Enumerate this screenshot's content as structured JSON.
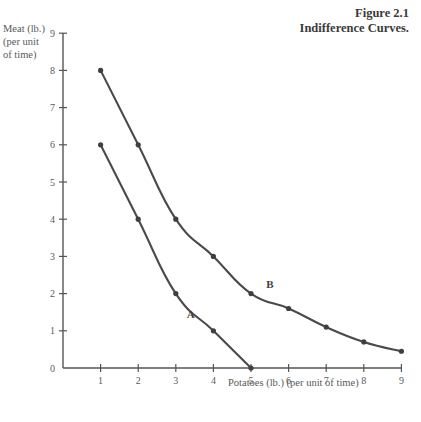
{
  "figure": {
    "title_line_1": "Figure 2.1",
    "title_line_2": "Indifference Curves."
  },
  "axes": {
    "y_caption_line_1": "Meat (lb.)",
    "y_caption_line_2": "(per unit",
    "y_caption_line_3": "of time)",
    "x_caption": "Potatoes (lb.) (per unit of time)",
    "x_ticks": [
      "1",
      "2",
      "3",
      "4",
      "5",
      "6",
      "7",
      "8",
      "9"
    ],
    "y_ticks": [
      "0",
      "1",
      "2",
      "3",
      "4",
      "5",
      "6",
      "7",
      "8",
      "9"
    ]
  },
  "labels": {
    "curve_a": "A",
    "curve_b": "B"
  },
  "colors": {
    "line": "#4a4a4a",
    "point": "#3f3f3f",
    "axis": "#555555",
    "text": "#5a5a5a",
    "title": "#3a3a3a",
    "background": "#ffffff"
  },
  "chart_data": {
    "type": "line",
    "title": "Figure 2.1 Indifference Curves.",
    "xlabel": "Potatoes (lb.) (per unit of time)",
    "ylabel": "Meat (lb.) (per unit of time)",
    "xlim": [
      0,
      9
    ],
    "ylim": [
      0,
      9
    ],
    "xticks": [
      1,
      2,
      3,
      4,
      5,
      6,
      7,
      8,
      9
    ],
    "yticks": [
      0,
      1,
      2,
      3,
      4,
      5,
      6,
      7,
      8,
      9
    ],
    "grid": false,
    "legend": "inline-curve-labels",
    "series": [
      {
        "name": "A",
        "label_position": {
          "x": 3.4,
          "y": 1.35
        },
        "x": [
          1,
          2,
          3,
          4,
          5
        ],
        "y": [
          6,
          4,
          2,
          1,
          0
        ]
      },
      {
        "name": "B",
        "label_position": {
          "x": 5.5,
          "y": 2.15
        },
        "x": [
          1,
          2,
          3,
          4,
          5,
          6,
          7,
          8,
          9
        ],
        "y": [
          8,
          6,
          4,
          3,
          2,
          1.6,
          1.1,
          0.7,
          0.45
        ]
      }
    ]
  }
}
